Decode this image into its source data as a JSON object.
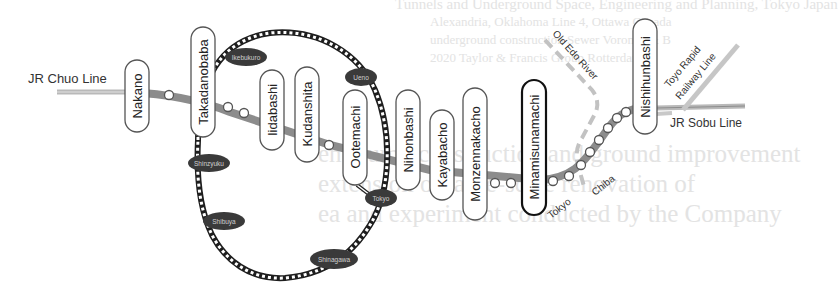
{
  "figure": {
    "colors": {
      "tozai_line": "#8c8c8c",
      "jr_line": "#b9b9b9",
      "yamanote_line": "#222222",
      "jr_station_fill": "#3a3a3a",
      "station_box_border": "#555555",
      "highlight_station_border": "#111111",
      "river": "#bdbdbd"
    },
    "lines": {
      "jr_chuo": "JR Chuo Line",
      "jr_sobu": "JR Sobu Line",
      "toyo_rapid_1": "Toyo Rapid",
      "toyo_rapid_2": "Railway Line",
      "old_edo_river": "Old Edo River"
    },
    "direction_labels": {
      "tokyo": "Tokyo",
      "chiba": "Chiba"
    },
    "tozai_stations": [
      {
        "name": "Nakano"
      },
      {
        "name": "Takadanobaba"
      },
      {
        "name": "Iidabashi"
      },
      {
        "name": "Kudanshita"
      },
      {
        "name": "Ootemachi"
      },
      {
        "name": "Nihonbashi"
      },
      {
        "name": "Kayabacho"
      },
      {
        "name": "Monzennakacho"
      },
      {
        "name": "Minamisunamachi"
      },
      {
        "name": "Nishihunbashi"
      }
    ],
    "yamanote_stations": [
      {
        "name": "Ikebukuro"
      },
      {
        "name": "Ueno"
      },
      {
        "name": "Shinzyuku"
      },
      {
        "name": "Tokyo"
      },
      {
        "name": "Shibuya"
      },
      {
        "name": "Shinagawa"
      }
    ]
  },
  "bleed_through_text": [
    "Tunnels and Underground Space, Engineering and Planning, Tokyo Japan",
    "Alexandria, Oklahoma Line 4, Ottawa Canada",
    "underground construction Sewer Voronez & B",
    "2020 Taylor & Francis Group Rotterdam",
    "ent pump construction and ground improvement",
    "extension of large-scale renovation of",
    "ea and experiment conducted by the Company"
  ]
}
